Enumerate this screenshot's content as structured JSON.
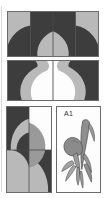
{
  "figure": {
    "background_color": "#ffffff",
    "width": 106,
    "height": 198
  },
  "palette": {
    "light_gray": "#b9b9b9",
    "mid_gray": "#9a9a9a",
    "dark_gray": "#3d3d3d",
    "white": "#fdfdfd",
    "outline": "#6b6b6b",
    "seam_line": "#4a4a4a",
    "label_text": "#2e2e2e"
  },
  "panels": [
    {
      "name": "four-unit-strip",
      "label": "",
      "units": 4,
      "arrangement": "1x4",
      "description": "Horizontal strip of four pieced units forming a dark arch on light ground"
    },
    {
      "name": "two-unit-strip",
      "label": "",
      "units": 2,
      "arrangement": "1x2",
      "description": "Horizontal strip of two mirrored pieced units with white centers"
    },
    {
      "name": "four-patch-block",
      "label": "",
      "units": 4,
      "arrangement": "2x2",
      "description": "Two by two block of quarter units creating rotated curved motif"
    },
    {
      "name": "motif-block",
      "label": "A1",
      "units": 1,
      "arrangement": "1x1",
      "description": "Single block with stylized appliqued flower and leaf motif"
    }
  ],
  "motif": {
    "block_label": "A1",
    "subject": "flower-and-leaf-appliqué"
  }
}
